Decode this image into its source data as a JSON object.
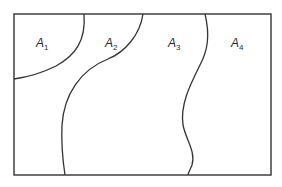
{
  "diagram": {
    "regions": [
      {
        "id": "A1",
        "letter": "A",
        "sub": "1"
      },
      {
        "id": "A2",
        "letter": "A",
        "sub": "2"
      },
      {
        "id": "A3",
        "letter": "A",
        "sub": "3"
      },
      {
        "id": "A4",
        "letter": "A",
        "sub": "4"
      }
    ],
    "stroke_color": "#333333"
  }
}
